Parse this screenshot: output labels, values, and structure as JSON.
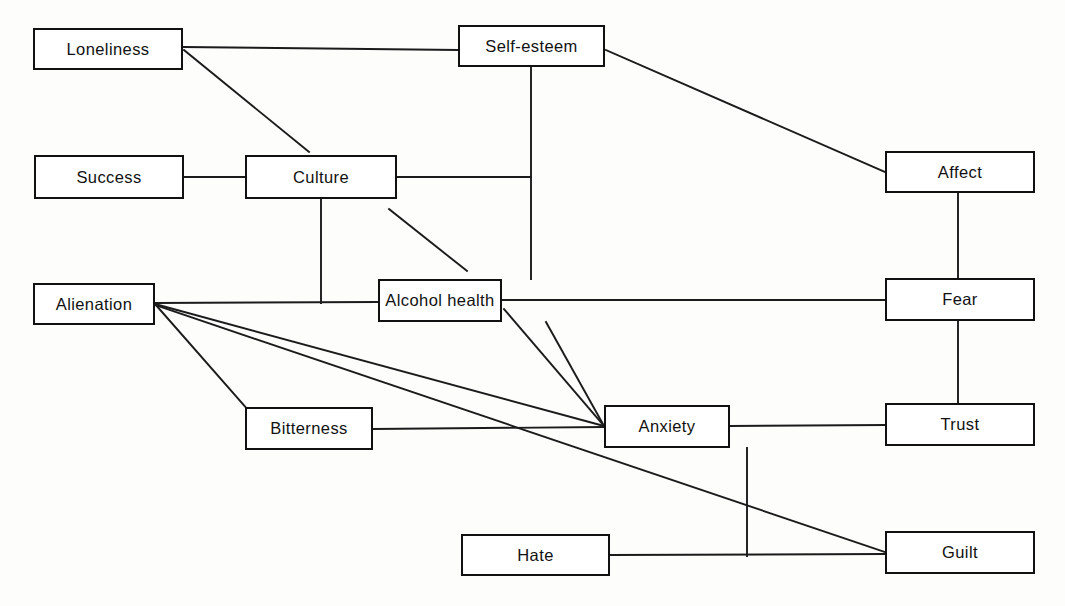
{
  "diagram": {
    "background_color": "#fdfdfc",
    "line_color": "#1b1b1b",
    "box_border_color": "#111111",
    "box_fill_color": "#ffffff",
    "canvas": {
      "width": 1065,
      "height": 606
    },
    "nodes": [
      {
        "id": "loneliness",
        "label": "Loneliness",
        "x": 33,
        "y": 28,
        "w": 150,
        "h": 42
      },
      {
        "id": "self_esteem",
        "label": "Self-esteem",
        "x": 458,
        "y": 25,
        "w": 147,
        "h": 42
      },
      {
        "id": "success",
        "label": "Success",
        "x": 34,
        "y": 155,
        "w": 150,
        "h": 44
      },
      {
        "id": "culture",
        "label": "Culture",
        "x": 245,
        "y": 155,
        "w": 152,
        "h": 44
      },
      {
        "id": "affect",
        "label": "Affect",
        "x": 885,
        "y": 151,
        "w": 150,
        "h": 42
      },
      {
        "id": "alienation",
        "label": "Alienation",
        "x": 33,
        "y": 283,
        "w": 122,
        "h": 42
      },
      {
        "id": "alcohol_health",
        "label": "Alcohol health",
        "x": 378,
        "y": 279,
        "w": 124,
        "h": 43
      },
      {
        "id": "fear",
        "label": "Fear",
        "x": 885,
        "y": 278,
        "w": 150,
        "h": 43
      },
      {
        "id": "bitterness",
        "label": "Bitterness",
        "x": 245,
        "y": 407,
        "w": 128,
        "h": 43
      },
      {
        "id": "anxiety",
        "label": "Anxiety",
        "x": 604,
        "y": 405,
        "w": 126,
        "h": 43
      },
      {
        "id": "trust",
        "label": "Trust",
        "x": 885,
        "y": 403,
        "w": 150,
        "h": 43
      },
      {
        "id": "hate",
        "label": "Hate",
        "x": 461,
        "y": 534,
        "w": 149,
        "h": 42
      },
      {
        "id": "guilt",
        "label": "Guilt",
        "x": 885,
        "y": 531,
        "w": 150,
        "h": 43
      }
    ],
    "edges": [
      {
        "id": "loneliness-self_esteem",
        "from": "loneliness",
        "to": "self_esteem",
        "x1": 183,
        "y1": 47,
        "x2": 458,
        "y2": 50
      },
      {
        "id": "loneliness-culture",
        "from": "loneliness",
        "to": "culture",
        "x1": 184,
        "y1": 50,
        "x2": 309,
        "y2": 152
      },
      {
        "id": "self_esteem-affect",
        "from": "self_esteem",
        "to": "affect",
        "x1": 606,
        "y1": 50,
        "x2": 885,
        "y2": 172
      },
      {
        "id": "self_esteem-alcohol_health",
        "from": "self_esteem",
        "to": "alcohol_health",
        "x1": 531,
        "y1": 67,
        "x2": 531,
        "y2": 279
      },
      {
        "id": "success-culture",
        "from": "success",
        "to": "culture",
        "x1": 184,
        "y1": 177,
        "x2": 245,
        "y2": 177
      },
      {
        "id": "culture-self_esteem_stem",
        "from": "culture",
        "to": "self_esteem",
        "x1": 397,
        "y1": 177,
        "x2": 531,
        "y2": 177
      },
      {
        "id": "culture-alcohol_health",
        "from": "culture",
        "to": "alcohol_health",
        "x1": 389,
        "y1": 209,
        "x2": 467,
        "y2": 271
      },
      {
        "id": "culture-alienation_line",
        "from": "culture",
        "to": "alienation",
        "x1": 321,
        "y1": 199,
        "x2": 321,
        "y2": 303
      },
      {
        "id": "alienation-alcohol_health",
        "from": "alienation",
        "to": "alcohol_health",
        "x1": 155,
        "y1": 303,
        "x2": 378,
        "y2": 302
      },
      {
        "id": "alienation-bitterness",
        "from": "alienation",
        "to": "bitterness",
        "x1": 155,
        "y1": 304,
        "x2": 248,
        "y2": 410
      },
      {
        "id": "alienation-anxiety",
        "from": "alienation",
        "to": "anxiety",
        "x1": 155,
        "y1": 304,
        "x2": 604,
        "y2": 426
      },
      {
        "id": "alienation-guilt",
        "from": "alienation",
        "to": "guilt",
        "x1": 155,
        "y1": 305,
        "x2": 885,
        "y2": 552
      },
      {
        "id": "alcohol_health-fear",
        "from": "alcohol_health",
        "to": "fear",
        "x1": 502,
        "y1": 300,
        "x2": 885,
        "y2": 300
      },
      {
        "id": "alcohol_health-anxiety_a",
        "from": "alcohol_health",
        "to": "anxiety",
        "x1": 504,
        "y1": 309,
        "x2": 604,
        "y2": 426
      },
      {
        "id": "alcohol_health-anxiety_b",
        "from": "alcohol_health",
        "to": "anxiety",
        "x1": 546,
        "y1": 322,
        "x2": 604,
        "y2": 426
      },
      {
        "id": "bitterness-anxiety",
        "from": "bitterness",
        "to": "anxiety",
        "x1": 373,
        "y1": 429,
        "x2": 604,
        "y2": 427
      },
      {
        "id": "anxiety-trust",
        "from": "anxiety",
        "to": "trust",
        "x1": 730,
        "y1": 426,
        "x2": 885,
        "y2": 425
      },
      {
        "id": "anxiety-hate_guilt_line",
        "from": "anxiety",
        "to": "hate",
        "x1": 747,
        "y1": 448,
        "x2": 747,
        "y2": 556
      },
      {
        "id": "affect-fear",
        "from": "affect",
        "to": "fear",
        "x1": 958,
        "y1": 193,
        "x2": 958,
        "y2": 278
      },
      {
        "id": "fear-trust",
        "from": "fear",
        "to": "trust",
        "x1": 958,
        "y1": 321,
        "x2": 958,
        "y2": 403
      },
      {
        "id": "hate-guilt",
        "from": "hate",
        "to": "guilt",
        "x1": 610,
        "y1": 555,
        "x2": 885,
        "y2": 554
      }
    ]
  }
}
